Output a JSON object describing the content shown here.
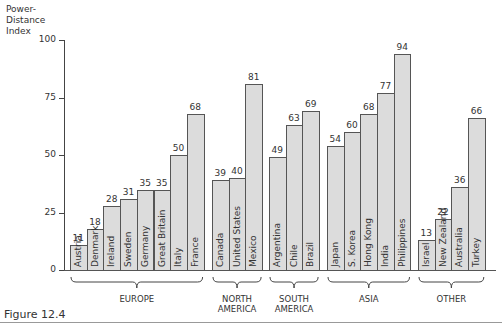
{
  "figure_label": "Figure 12.4",
  "y_axis_label": [
    "Power-",
    "Distance",
    "Index"
  ],
  "colors": {
    "bar_fill": "#dcdcdc",
    "bar_stroke": "#555555",
    "text": "#333333"
  },
  "chart_data": {
    "type": "bar",
    "title": "",
    "ylabel": "Power-Distance Index",
    "xlabel": "",
    "ylim": [
      0,
      100
    ],
    "yticks": [
      0,
      25,
      50,
      75,
      100
    ],
    "grid": false,
    "legend": null,
    "groups": [
      {
        "name": "EUROPE",
        "categories": [
          "Austria",
          "Denmark",
          "Ireland",
          "Sweden",
          "Germany",
          "Great Britain",
          "Italy",
          "France"
        ],
        "values": [
          11,
          18,
          28,
          31,
          35,
          35,
          50,
          68
        ]
      },
      {
        "name": "NORTH AMERICA",
        "categories": [
          "Canada",
          "United States",
          "Mexico"
        ],
        "values": [
          39,
          40,
          81
        ]
      },
      {
        "name": "SOUTH AMERICA",
        "categories": [
          "Argentina",
          "Chile",
          "Brazil"
        ],
        "values": [
          49,
          63,
          69
        ]
      },
      {
        "name": "ASIA",
        "categories": [
          "Japan",
          "S. Korea",
          "Hong Kong",
          "India",
          "Philippines"
        ],
        "values": [
          54,
          60,
          68,
          77,
          94
        ]
      },
      {
        "name": "OTHER",
        "categories": [
          "Israel",
          "New Zealand",
          "Australia",
          "Turkey"
        ],
        "values": [
          13,
          22,
          36,
          66
        ]
      }
    ],
    "categories": [
      "Austria",
      "Denmark",
      "Ireland",
      "Sweden",
      "Germany",
      "Great Britain",
      "Italy",
      "France",
      "Canada",
      "United States",
      "Mexico",
      "Argentina",
      "Chile",
      "Brazil",
      "Japan",
      "S. Korea",
      "Hong Kong",
      "India",
      "Philippines",
      "Israel",
      "New Zealand",
      "Australia",
      "Turkey"
    ],
    "values": [
      11,
      18,
      28,
      31,
      35,
      35,
      50,
      68,
      39,
      40,
      81,
      49,
      63,
      69,
      54,
      60,
      68,
      77,
      94,
      13,
      22,
      36,
      66
    ]
  },
  "group_labels": [
    {
      "line1": "EUROPE",
      "line2": ""
    },
    {
      "line1": "NORTH",
      "line2": "AMERICA"
    },
    {
      "line1": "SOUTH",
      "line2": "AMERICA"
    },
    {
      "line1": "ASIA",
      "line2": ""
    },
    {
      "line1": "OTHER",
      "line2": ""
    }
  ]
}
